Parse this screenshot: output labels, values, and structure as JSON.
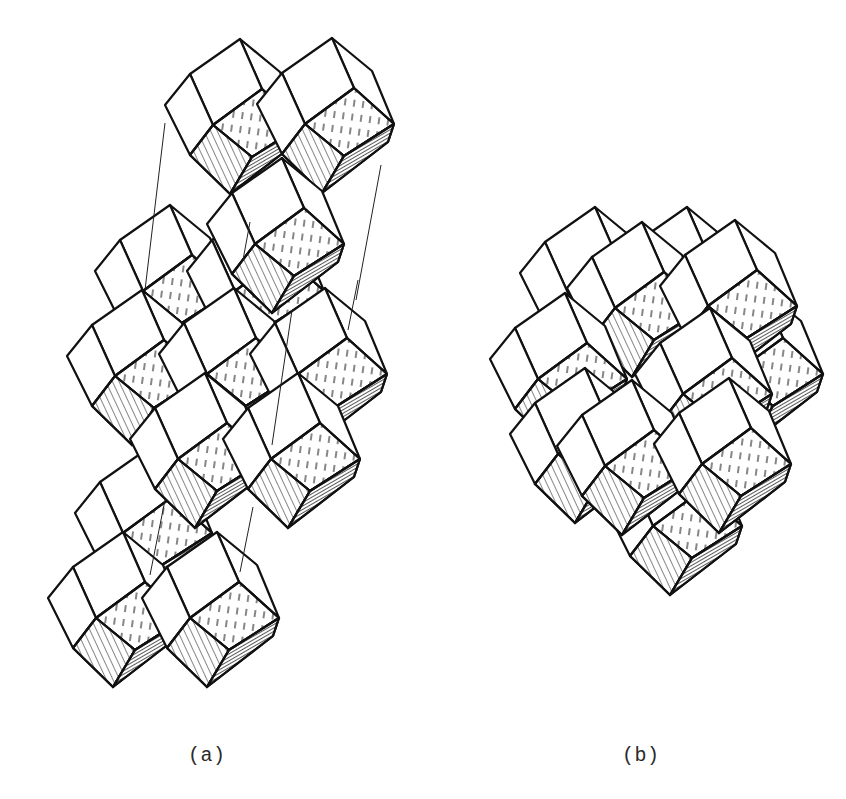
{
  "figure": {
    "panels": [
      {
        "id": "a",
        "label": "(a)",
        "description": "exploded view of stacked layers with guide lines",
        "cells": [
          {
            "name": "a-back-left-mid",
            "x": 170,
            "y": 205
          },
          {
            "name": "a-back-right-mid",
            "x": 262,
            "y": 205
          },
          {
            "name": "a-top-left",
            "x": 240,
            "y": 39
          },
          {
            "name": "a-top-right",
            "x": 332,
            "y": 38
          },
          {
            "name": "a-front-left-mid",
            "x": 142,
            "y": 290
          },
          {
            "name": "a-front-center-mid",
            "x": 234,
            "y": 288
          },
          {
            "name": "a-front-right-mid",
            "x": 325,
            "y": 288
          },
          {
            "name": "a-top-front",
            "x": 282,
            "y": 158
          },
          {
            "name": "a-lower-back",
            "x": 150,
            "y": 447
          },
          {
            "name": "a-lower-left",
            "x": 205,
            "y": 373
          },
          {
            "name": "a-lower-right",
            "x": 298,
            "y": 373
          },
          {
            "name": "a-bottom-left",
            "x": 123,
            "y": 532
          },
          {
            "name": "a-bottom-right",
            "x": 217,
            "y": 532
          }
        ],
        "guide_lines": [
          [
            165,
            123,
            145,
            290
          ],
          [
            381,
            165,
            356,
            300
          ],
          [
            358,
            280,
            348,
            330
          ],
          [
            292,
            310,
            272,
            445
          ],
          [
            253,
            507,
            240,
            572
          ],
          [
            165,
            500,
            150,
            575
          ],
          [
            250,
            222,
            243,
            260
          ]
        ]
      },
      {
        "id": "b",
        "label": "(b)",
        "description": "assembled cluster",
        "cells": [
          {
            "name": "b-back-top-left",
            "x": 595,
            "y": 207
          },
          {
            "name": "b-back-top-right",
            "x": 687,
            "y": 207
          },
          {
            "name": "b-back-right",
            "x": 761,
            "y": 288
          },
          {
            "name": "b-back-bottom",
            "x": 680,
            "y": 440
          },
          {
            "name": "b-top-middle",
            "x": 642,
            "y": 222
          },
          {
            "name": "b-top-right",
            "x": 735,
            "y": 220
          },
          {
            "name": "b-mid-left",
            "x": 565,
            "y": 293
          },
          {
            "name": "b-mid-right",
            "x": 710,
            "y": 308
          },
          {
            "name": "b-bottom-left",
            "x": 585,
            "y": 368
          },
          {
            "name": "b-bottom-middle",
            "x": 632,
            "y": 380
          },
          {
            "name": "b-bottom-right",
            "x": 729,
            "y": 378
          }
        ],
        "guide_lines": []
      }
    ]
  },
  "labels": {
    "a": "(a)",
    "b": "(b)"
  },
  "style": {
    "ink": "#111111",
    "paper": "#ffffff"
  }
}
